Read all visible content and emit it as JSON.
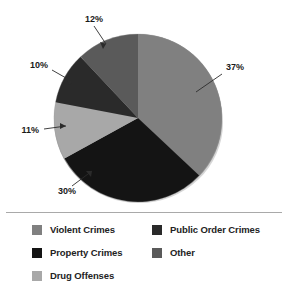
{
  "chart_data": {
    "type": "pie",
    "title": "",
    "subtitle": "",
    "xlabel": "",
    "ylabel": "",
    "legend_position": "bottom",
    "grid": false,
    "categories": [
      "Violent Crimes",
      "Property Crimes",
      "Drug Offenses",
      "Public Order Crimes",
      "Other"
    ],
    "values": [
      37,
      30,
      11,
      10,
      12
    ],
    "value_unit": "%",
    "data_labels": [
      "37%",
      "30%",
      "11%",
      "10%",
      "12%"
    ],
    "colors": [
      "#808080",
      "#141414",
      "#a8a8a8",
      "#2a2a2a",
      "#5a5a5a"
    ],
    "start_angle_deg": 0,
    "direction": "clockwise",
    "slices": [
      {
        "label": "Violent Crimes",
        "value": 37,
        "data_label": "37%",
        "color": "#808080"
      },
      {
        "label": "Property Crimes",
        "value": 30,
        "data_label": "30%",
        "color": "#141414"
      },
      {
        "label": "Drug Offenses",
        "value": 11,
        "data_label": "11%",
        "color": "#a8a8a8"
      },
      {
        "label": "Public Order Crimes",
        "value": 10,
        "data_label": "10%",
        "color": "#2a2a2a"
      },
      {
        "label": "Other",
        "value": 12,
        "data_label": "12%",
        "color": "#5a5a5a"
      }
    ]
  },
  "pie": {
    "labels": {
      "violent": "37%",
      "property": "30%",
      "drug": "11%",
      "public_order": "10%",
      "other": "12%"
    }
  },
  "legend": {
    "columns": [
      {
        "items": [
          {
            "label": "Violent Crimes",
            "color": "#808080"
          },
          {
            "label": "Property Crimes",
            "color": "#141414"
          },
          {
            "label": "Drug Offenses",
            "color": "#a8a8a8"
          }
        ]
      },
      {
        "items": [
          {
            "label": "Public Order Crimes",
            "color": "#2a2a2a"
          },
          {
            "label": "Other",
            "color": "#5a5a5a"
          }
        ]
      }
    ]
  },
  "style": {
    "background": "#ffffff",
    "divider_color": "#a9a9a9",
    "label_color": "#1a1a1a"
  }
}
